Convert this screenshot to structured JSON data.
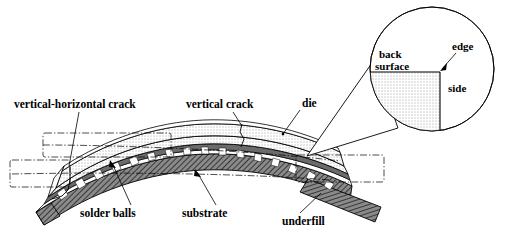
{
  "figure": {
    "background_color": "#ffffff",
    "line_color": "#000000"
  },
  "labels": {
    "vertical_horizontal_crack": "vertical-horizontal crack",
    "vertical_crack": "vertical crack",
    "die": "die",
    "solder_balls": "solder balls",
    "substrate": "substrate",
    "underfill": "underfill"
  },
  "callout": {
    "back_surface_line1": "back",
    "back_surface_line2": "surface",
    "edge": "edge",
    "side": "side"
  },
  "materials": {
    "die_fill": "#ffffff",
    "die_pattern": "dotted",
    "substrate_fill": "#7d7d7d",
    "substrate_pattern": "diagonal-hatch",
    "underfill_fill": "#ffffff",
    "solder_ball_fill": "#6b6b6b",
    "solder_gap_fill": "#ffffff"
  },
  "regions": {
    "crack_box_left_upper": "dash-dot rectangle",
    "crack_box_left_lower": "dash-dot rectangle",
    "crack_box_right": "dash-dot rectangle",
    "magnifier": "circle"
  }
}
